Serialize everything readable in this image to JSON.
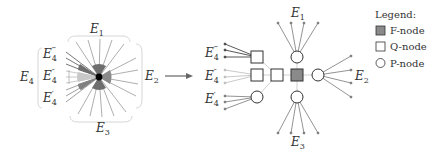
{
  "left_diagram": {
    "labels": {
      "E1": {
        "base": "E",
        "sub": "1"
      },
      "E2": {
        "base": "E",
        "sub": "2"
      },
      "E3": {
        "base": "E",
        "sub": "3"
      },
      "E4": {
        "base": "E",
        "sub": "4"
      },
      "E4_triple": {
        "base": "E",
        "sub": "4",
        "sup": "‴"
      },
      "E4_double": {
        "base": "E",
        "sub": "4",
        "sup": "″"
      },
      "E4_single": {
        "base": "E",
        "sub": "4",
        "sup": "′"
      }
    }
  },
  "arrow": {
    "direction": "right"
  },
  "right_diagram": {
    "labels": {
      "E1": {
        "base": "E",
        "sub": "1"
      },
      "E2": {
        "base": "E",
        "sub": "2"
      },
      "E3": {
        "base": "E",
        "sub": "3"
      },
      "E4_triple": {
        "base": "E",
        "sub": "4",
        "sup": "‴"
      },
      "E4_double": {
        "base": "E",
        "sub": "4",
        "sup": "″"
      },
      "E4_single": {
        "base": "E",
        "sub": "4",
        "sup": "′"
      }
    }
  },
  "legend": {
    "title": "Legend:",
    "items": [
      {
        "shape": "filled-square",
        "label": "F-node",
        "color": "#8a8a8a"
      },
      {
        "shape": "square",
        "label": "Q-node"
      },
      {
        "shape": "circle",
        "label": "P-node"
      }
    ]
  },
  "colors": {
    "edge_dark": "#555555",
    "edge_mid": "#888888",
    "edge_light": "#bbbbbb",
    "f_node": "#8a8a8a",
    "wedge_dark": "#6e6e6e",
    "wedge_light": "#c8c8c8"
  }
}
